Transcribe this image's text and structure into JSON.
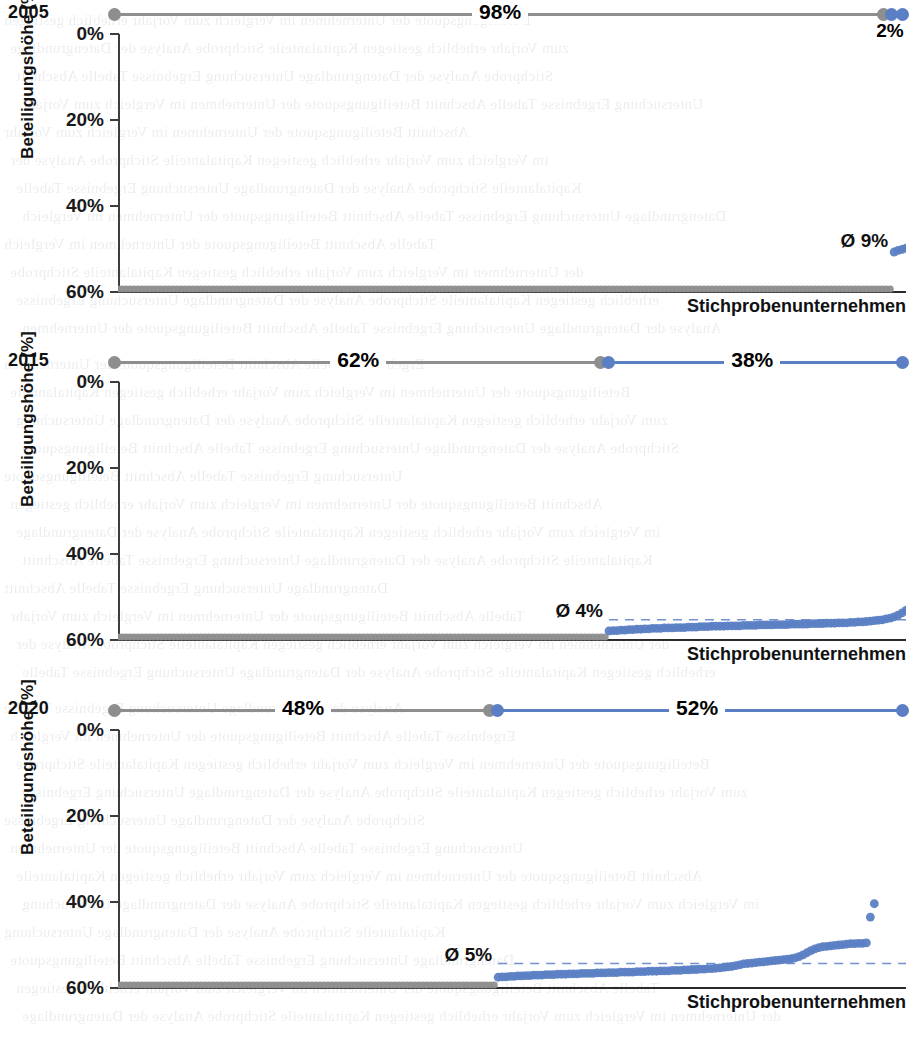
{
  "figure": {
    "axis_label_y": "Beteiligungshöhe [%]",
    "axis_label_x": "Stichprobenunternehmen",
    "colors": {
      "grey": "#8e8e8e",
      "blue": "#5b7fc4",
      "axis": "#2b2b2b"
    }
  },
  "panels": [
    {
      "year": "2005",
      "grey_share_label": "98%",
      "blue_share_label": "2%",
      "avg_label": "Ø 9%",
      "ticks": [
        "60%",
        "40%",
        "20%",
        "0%"
      ]
    },
    {
      "year": "2015",
      "grey_share_label": "62%",
      "blue_share_label": "38%",
      "avg_label": "Ø 4%",
      "ticks": [
        "60%",
        "40%",
        "20%",
        "0%"
      ]
    },
    {
      "year": "2020",
      "grey_share_label": "48%",
      "blue_share_label": "52%",
      "avg_label": "Ø 5%",
      "ticks": [
        "60%",
        "40%",
        "20%",
        "0%"
      ]
    }
  ],
  "chart_data": {
    "type": "scatter",
    "xlabel": "Stichprobenunternehmen",
    "ylabel": "Beteiligungshöhe [%]",
    "ylim": [
      0,
      62
    ],
    "yticks": [
      0,
      20,
      40,
      60
    ],
    "ytick_labels": [
      "0%",
      "20%",
      "40%",
      "60%"
    ],
    "grid": false,
    "legend": null,
    "panels": [
      {
        "year": 2005,
        "grey_share_pct": 98,
        "blue_share_pct": 2,
        "average_pct": 9,
        "average_label": "Ø 9%",
        "n_points": 200,
        "split_index": 196,
        "grey_values_pct": 0,
        "blue_values_pct": [
          8.6,
          9.0,
          9.2,
          9.5
        ]
      },
      {
        "year": 2015,
        "grey_share_pct": 62,
        "blue_share_pct": 38,
        "average_pct": 4,
        "average_label": "Ø 4%",
        "n_points": 200,
        "split_index": 124,
        "grey_values_pct": 0,
        "blue_values_pct": [
          1.4,
          1.5,
          1.5,
          1.6,
          1.6,
          1.7,
          1.7,
          1.8,
          1.8,
          1.9,
          1.9,
          2.0,
          2.0,
          2.0,
          2.1,
          2.1,
          2.1,
          2.2,
          2.2,
          2.2,
          2.3,
          2.3,
          2.3,
          2.4,
          2.4,
          2.4,
          2.5,
          2.5,
          2.5,
          2.5,
          2.6,
          2.6,
          2.6,
          2.6,
          2.7,
          2.7,
          2.7,
          2.7,
          2.8,
          2.8,
          2.8,
          2.8,
          2.9,
          2.9,
          2.9,
          2.9,
          3.0,
          3.0,
          3.0,
          3.0,
          3.0,
          3.1,
          3.1,
          3.1,
          3.1,
          3.2,
          3.2,
          3.2,
          3.3,
          3.3,
          3.3,
          3.4,
          3.4,
          3.5,
          3.5,
          3.6,
          3.7,
          3.8,
          3.9,
          4.0,
          4.2,
          4.4,
          4.7,
          5.1,
          5.6,
          6.2,
          7.0,
          7.8,
          8.6,
          9.3,
          9.8,
          10.2,
          10.5,
          10.7,
          10.9,
          11.0,
          11.1,
          11.2,
          19.2,
          19.4
        ]
      },
      {
        "year": 2020,
        "grey_share_pct": 48,
        "blue_share_pct": 52,
        "average_pct": 5,
        "average_label": "Ø 5%",
        "n_points": 200,
        "split_index": 96,
        "grey_values_pct": 0,
        "blue_values_pct": [
          1.8,
          1.9,
          1.9,
          2.0,
          2.0,
          2.1,
          2.1,
          2.2,
          2.2,
          2.3,
          2.3,
          2.3,
          2.4,
          2.4,
          2.4,
          2.5,
          2.5,
          2.5,
          2.6,
          2.6,
          2.6,
          2.7,
          2.7,
          2.7,
          2.7,
          2.8,
          2.8,
          2.8,
          2.9,
          2.9,
          2.9,
          3.0,
          3.0,
          3.0,
          3.0,
          3.1,
          3.1,
          3.1,
          3.2,
          3.2,
          3.2,
          3.3,
          3.3,
          3.3,
          3.4,
          3.4,
          3.4,
          3.5,
          3.5,
          3.6,
          3.6,
          3.7,
          3.7,
          3.8,
          3.8,
          3.9,
          4.0,
          4.1,
          4.2,
          4.3,
          4.5,
          4.7,
          4.9,
          5.0,
          5.1,
          5.2,
          5.3,
          5.4,
          5.5,
          5.6,
          5.7,
          5.8,
          5.9,
          6.0,
          6.1,
          6.3,
          6.6,
          7.0,
          7.5,
          8.0,
          8.4,
          8.7,
          8.9,
          9.0,
          9.1,
          9.2,
          9.3,
          9.4,
          9.5,
          9.6,
          9.6,
          9.7,
          9.7,
          9.8,
          15.8,
          18.9
        ]
      }
    ]
  }
}
